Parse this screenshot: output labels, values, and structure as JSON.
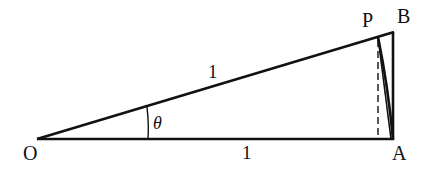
{
  "diagram": {
    "type": "geometry",
    "colors": {
      "stroke": "#111111",
      "background": "#ffffff"
    },
    "points": {
      "O": {
        "label": "O",
        "x": 37,
        "y": 139
      },
      "A": {
        "label": "A",
        "x": 393,
        "y": 139
      },
      "B": {
        "label": "B",
        "x": 393,
        "y": 32
      },
      "P": {
        "label": "P",
        "x": 378,
        "y": 37
      }
    },
    "labels": {
      "O": "O",
      "A": "A",
      "B": "B",
      "P": "P",
      "hypotenuse_length": "1",
      "base_length": "1",
      "angle": "θ"
    },
    "segments": [
      {
        "from": "O",
        "to": "A",
        "style": "solid"
      },
      {
        "from": "O",
        "to": "B",
        "style": "solid"
      },
      {
        "from": "A",
        "to": "B",
        "style": "solid"
      },
      {
        "from": "P",
        "to": "A",
        "style": "solid",
        "note": "chord"
      },
      {
        "from": "P",
        "to": "foot",
        "style": "dashed",
        "note": "perpendicular from P to OA"
      }
    ],
    "arcs": [
      {
        "name": "sector-arc",
        "from": "A",
        "to": "P",
        "center": "O"
      },
      {
        "name": "angle-marker",
        "at": "O",
        "label": "θ"
      }
    ]
  }
}
